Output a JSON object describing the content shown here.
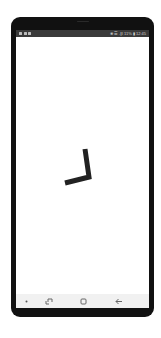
{
  "device": {
    "frame_color": "#111111",
    "screen_background": "#ffffff"
  },
  "status_bar": {
    "background": "#3a3a3a",
    "left_icons": [
      "warning-icon",
      "image-icon",
      "notification-icon"
    ],
    "right_text": "❀ ☰ .∥l 11% ▮ 12:45"
  },
  "content": {
    "graphic": "clock-hands-icon",
    "graphic_color": "#222222"
  },
  "nav_bar": {
    "background": "#f1f1f1",
    "items": [
      {
        "name": "nav-dot",
        "icon": "dot-icon"
      },
      {
        "name": "recent-apps-button",
        "icon": "recent-apps-icon"
      },
      {
        "name": "home-button",
        "icon": "home-icon"
      },
      {
        "name": "back-button",
        "icon": "back-arrow-icon"
      }
    ]
  }
}
